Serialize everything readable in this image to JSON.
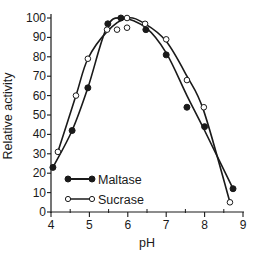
{
  "chart_data": {
    "type": "line",
    "title": "",
    "xlabel": "pH",
    "ylabel": "Relative activity",
    "xlim": [
      4,
      9
    ],
    "ylim": [
      0,
      100
    ],
    "x_ticks": [
      4,
      5,
      6,
      7,
      8,
      9
    ],
    "x_minor_ticks": [
      4.5,
      5.5,
      6.5,
      7.5,
      8.5
    ],
    "y_ticks": [
      0,
      10,
      20,
      30,
      40,
      50,
      60,
      70,
      80,
      90,
      100
    ],
    "grid": false,
    "legend_position": "lower-left-inside",
    "series": [
      {
        "name": "Maltase",
        "marker": "filled-circle",
        "color": "#1a1a1a",
        "points": [
          {
            "x": 4.05,
            "y": 23
          },
          {
            "x": 4.55,
            "y": 42
          },
          {
            "x": 4.96,
            "y": 64
          },
          {
            "x": 5.48,
            "y": 97
          },
          {
            "x": 5.82,
            "y": 100
          },
          {
            "x": 6.47,
            "y": 94
          },
          {
            "x": 7.0,
            "y": 81
          },
          {
            "x": 7.54,
            "y": 54
          },
          {
            "x": 8.0,
            "y": 44
          },
          {
            "x": 8.74,
            "y": 12
          }
        ]
      },
      {
        "name": "Sucrase",
        "marker": "open-circle",
        "color": "#1a1a1a",
        "points": [
          {
            "x": 4.18,
            "y": 31
          },
          {
            "x": 4.65,
            "y": 60
          },
          {
            "x": 4.96,
            "y": 79
          },
          {
            "x": 5.46,
            "y": 94
          },
          {
            "x": 5.72,
            "y": 94
          },
          {
            "x": 5.98,
            "y": 95
          },
          {
            "x": 5.98,
            "y": 100
          },
          {
            "x": 6.45,
            "y": 97
          },
          {
            "x": 7.0,
            "y": 89
          },
          {
            "x": 7.54,
            "y": 68
          },
          {
            "x": 7.98,
            "y": 54
          },
          {
            "x": 8.66,
            "y": 5
          }
        ]
      }
    ],
    "curves_note": "smooth fitted curves drawn through each series"
  }
}
